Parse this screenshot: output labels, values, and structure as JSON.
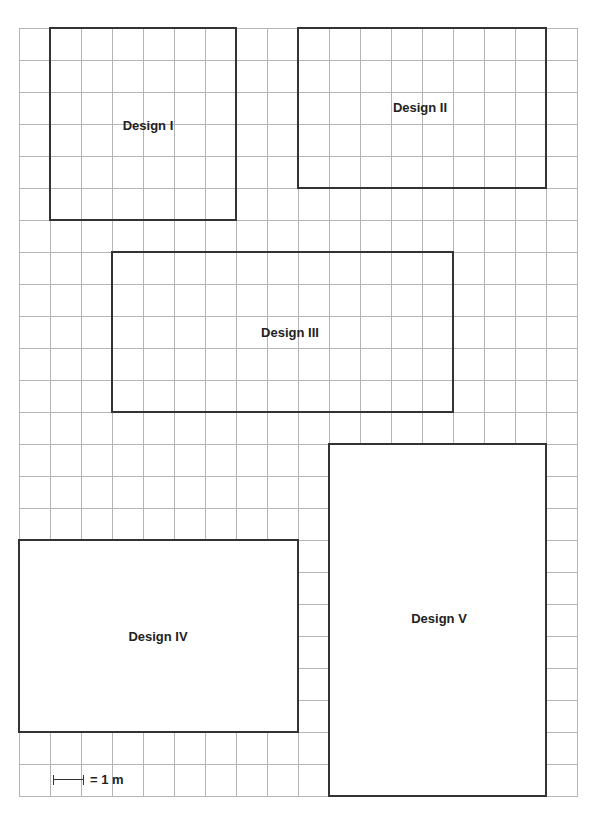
{
  "grid": {
    "columns": 18,
    "rows": 24,
    "cell_px_w": 31,
    "cell_px_h": 32,
    "line_color": "#b5b5b5"
  },
  "scale": {
    "bar_cells": 1,
    "label": "= 1 m"
  },
  "designs": [
    {
      "label": "Design I",
      "col": 1,
      "row": 0,
      "width_cells": 6,
      "height_cells": 6,
      "filled": false,
      "label_x": 148,
      "label_y": 126
    },
    {
      "label": "Design II",
      "col": 9,
      "row": 0,
      "width_cells": 8,
      "height_cells": 5,
      "filled": false,
      "label_x": 420,
      "label_y": 108
    },
    {
      "label": "Design III",
      "col": 3,
      "row": 7,
      "width_cells": 11,
      "height_cells": 5,
      "filled": false,
      "label_x": 290,
      "label_y": 333
    },
    {
      "label": "Design IV",
      "col": 0,
      "row": 16,
      "width_cells": 9,
      "height_cells": 6,
      "filled": true,
      "label_x": 158,
      "label_y": 637
    },
    {
      "label": "Design V",
      "col": 10,
      "row": 13,
      "width_cells": 7,
      "height_cells": 11,
      "filled": true,
      "label_x": 439,
      "label_y": 619
    }
  ],
  "colors": {
    "outline": "#333333",
    "text": "#222222",
    "background": "#ffffff"
  }
}
